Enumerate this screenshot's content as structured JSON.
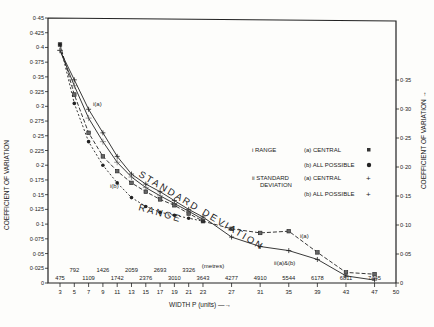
{
  "chart_data": {
    "type": "line",
    "title": "",
    "xlabel": "WIDTH  P  (units) →",
    "x2label": "(metres)",
    "ylabel": "COEFFICIENT OF VARIATION",
    "y2label": "COEFFICIENT OF VARIATION →",
    "xlim": [
      3,
      50
    ],
    "ylim": [
      0,
      0.45
    ],
    "y2lim": [
      0,
      0.35
    ],
    "grid": false,
    "x_ticks": [
      3,
      5,
      7,
      9,
      11,
      13,
      15,
      17,
      19,
      21,
      23,
      27,
      31,
      35,
      39,
      43,
      47,
      50
    ],
    "x_metre_labels": [
      {
        "x": 3,
        "label": "475",
        "row": 0
      },
      {
        "x": 5,
        "label": "792",
        "row": 1
      },
      {
        "x": 7,
        "label": "1109",
        "row": 0
      },
      {
        "x": 9,
        "label": "1426",
        "row": 1
      },
      {
        "x": 11,
        "label": "1742",
        "row": 0
      },
      {
        "x": 13,
        "label": "2059",
        "row": 1
      },
      {
        "x": 15,
        "label": "2376",
        "row": 0
      },
      {
        "x": 17,
        "label": "2693",
        "row": 1
      },
      {
        "x": 19,
        "label": "3010",
        "row": 0
      },
      {
        "x": 21,
        "label": "3326",
        "row": 1
      },
      {
        "x": 23,
        "label": "3643",
        "row": 0
      },
      {
        "x": 27,
        "label": "4277",
        "row": 0
      },
      {
        "x": 31,
        "label": "4910",
        "row": 0
      },
      {
        "x": 35,
        "label": "5544",
        "row": 0
      },
      {
        "x": 39,
        "label": "6178",
        "row": 0
      },
      {
        "x": 43,
        "label": "6811",
        "row": 0
      },
      {
        "x": 47,
        "label": "7445",
        "row": 0
      }
    ],
    "y_ticks": [
      "0",
      "0·025",
      "0·05",
      "0·075",
      "0·1",
      "0·125",
      "0·15",
      "0·175",
      "0·2",
      "0·225",
      "0·25",
      "0·275",
      "0·3",
      "0·325",
      "0·35",
      "0·375",
      "0·4",
      "0·425",
      "0·45"
    ],
    "y2_ticks": [
      "0",
      "0·05",
      "0·10",
      "0·15",
      "0·20",
      "0·25",
      "0·30",
      "0·35"
    ],
    "series": [
      {
        "name": "i Range (a) Central",
        "marker": "square",
        "dash": "4,2",
        "x": [
          3,
          5,
          7,
          9,
          11,
          13,
          15,
          17,
          19,
          21,
          23,
          27,
          31,
          35,
          39,
          43,
          47
        ],
        "values": [
          0.405,
          0.32,
          0.255,
          0.215,
          0.19,
          0.17,
          0.155,
          0.142,
          0.132,
          0.118,
          0.105,
          0.092,
          0.085,
          0.088,
          0.052,
          0.018,
          0.015
        ]
      },
      {
        "name": "i Range (b) All possible",
        "marker": "dot",
        "dash": "2,2",
        "x": [
          3,
          5,
          7,
          9,
          11,
          13,
          15,
          17,
          19,
          21,
          23
        ],
        "values": [
          0.405,
          0.305,
          0.24,
          0.2,
          0.17,
          0.145,
          0.13,
          0.12,
          0.115,
          0.11,
          0.105
        ]
      },
      {
        "name": "ii Standard deviation (a) Central",
        "marker": "plus",
        "dash": "",
        "x": [
          3,
          5,
          7,
          9,
          11,
          13,
          15,
          17,
          19,
          21,
          23,
          27,
          31,
          35,
          39,
          43,
          47
        ],
        "values": [
          0.395,
          0.345,
          0.295,
          0.255,
          0.215,
          0.185,
          0.168,
          0.155,
          0.14,
          0.125,
          0.112,
          0.078,
          0.062,
          0.055,
          0.04,
          0.012,
          0.005
        ]
      },
      {
        "name": "ii Standard deviation (b) All possible",
        "marker": "cross",
        "dash": "",
        "x": [
          3,
          5,
          7,
          9,
          11,
          13,
          15,
          17,
          19,
          21,
          23
        ],
        "values": [
          0.395,
          0.335,
          0.28,
          0.24,
          0.205,
          0.18,
          0.162,
          0.148,
          0.135,
          0.122,
          0.108
        ]
      }
    ],
    "annotations": [
      {
        "text": "i(a)",
        "x": 9.5,
        "y": 0.29
      },
      {
        "text": "i(b)",
        "x": 11,
        "y": 0.175
      },
      {
        "text": "i(a)",
        "x": 36,
        "y": 0.082
      },
      {
        "text": "ii(a)&(b)",
        "x": 35,
        "y": 0.05
      },
      {
        "text": "STANDARD DEVIATION",
        "rotated": true
      },
      {
        "text": "RANGE",
        "rotated": true
      }
    ],
    "legend": {
      "position": "right-middle",
      "groups": [
        {
          "label": "i  RANGE",
          "items": [
            {
              "text": "(a) CENTRAL",
              "marker": "▪"
            },
            {
              "text": "(b) ALL POSSIBLE",
              "marker": "●"
            }
          ]
        },
        {
          "label": "ii  STANDARD DEVIATION",
          "items": [
            {
              "text": "(a) CENTRAL",
              "marker": "+"
            },
            {
              "text": "(b) ALL POSSIBLE",
              "marker": "†"
            }
          ]
        }
      ]
    }
  },
  "labels": {
    "ylabel": "COEFFICIENT OF VARIATION",
    "y2label": "COEFFICIENT OF VARIATION →",
    "xlabel": "WIDTH  P  (units) —→",
    "metres": "(metres)",
    "sd_curve": "STANDARD DEVIATION",
    "range_curve": "RANGE",
    "ann_ia_top": "i(a)",
    "ann_ib": "i(b)",
    "ann_ia_right": "i(a)",
    "ann_iiab": "ii(a)&(b)",
    "legend_i": "i  RANGE",
    "legend_ii_1": "ii  STANDARD",
    "legend_ii_2": "DEVIATION",
    "legend_a1": "(a) CENTRAL",
    "legend_b1": "(b) ALL POSSIBLE",
    "legend_a2": "(a) CENTRAL",
    "legend_b2": "(b) ALL POSSIBLE"
  }
}
